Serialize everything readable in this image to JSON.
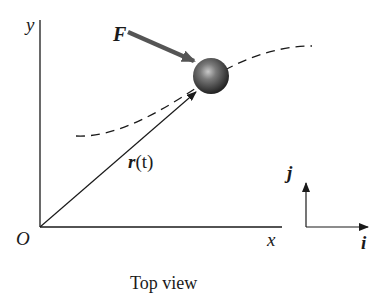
{
  "diagram": {
    "caption": "Top view",
    "labels": {
      "y_axis": "y",
      "x_axis": "x",
      "origin": "O",
      "force": "F",
      "position_vector_bold": "r",
      "position_vector_arg": "(t)",
      "unit_i": "i",
      "unit_j": "j"
    },
    "elements": {
      "particle": "sphere",
      "trajectory": "dashed curve",
      "force_arrow": "thick gray arrow pointing at particle",
      "position_vector": "arrow from origin O to particle",
      "unit_vector_frame": "i (right), j (up)"
    },
    "colors": {
      "ink": "#1a1a1a",
      "force_arrow": "#555555",
      "sphere_dark": "#2a2a2a",
      "sphere_light": "#bdbdbd",
      "background": "#ffffff"
    }
  }
}
